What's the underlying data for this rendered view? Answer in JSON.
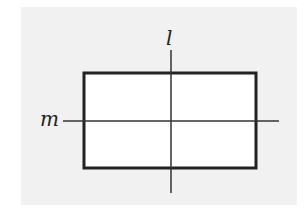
{
  "diagram": {
    "labels": {
      "vertical_line": "l",
      "horizontal_line": "m"
    },
    "colors": {
      "background_panel": "#f1f1f1",
      "rectangle_fill": "#ffffff",
      "stroke": "#222222"
    },
    "shapes": {
      "rectangle": {
        "x": 84,
        "y": 73,
        "width": 172,
        "height": 95
      },
      "vertical_line": {
        "x": 171,
        "y1": 50,
        "y2": 193
      },
      "horizontal_line": {
        "y": 121,
        "x1": 63,
        "x2": 279
      }
    }
  }
}
